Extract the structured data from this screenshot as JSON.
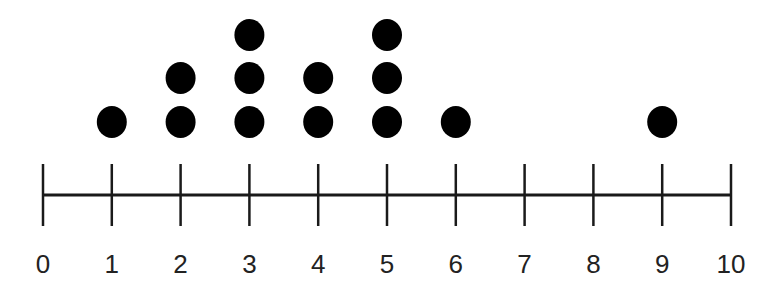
{
  "chart_data": {
    "type": "dot",
    "title": "",
    "xlabel": "",
    "ylabel": "",
    "xlim": [
      0,
      10
    ],
    "ticks": [
      0,
      1,
      2,
      3,
      4,
      5,
      6,
      7,
      8,
      9,
      10
    ],
    "tick_labels": [
      "0",
      "1",
      "2",
      "3",
      "4",
      "5",
      "6",
      "7",
      "8",
      "9",
      "10"
    ],
    "categories": [
      0,
      1,
      2,
      3,
      4,
      5,
      6,
      7,
      8,
      9,
      10
    ],
    "values": [
      0,
      1,
      2,
      3,
      2,
      3,
      1,
      0,
      0,
      1,
      0
    ],
    "points": [
      1,
      2,
      2,
      3,
      3,
      3,
      4,
      4,
      5,
      5,
      5,
      6,
      9
    ],
    "grid": false,
    "legend": null
  },
  "style": {
    "dot_color": "#000000",
    "axis_color": "#1a1a1a",
    "label_color": "#222222"
  }
}
